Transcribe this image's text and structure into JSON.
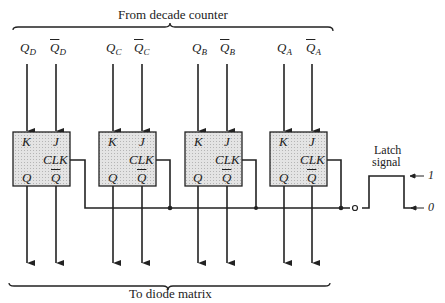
{
  "title_top": "From decade counter",
  "title_bottom": "To diode matrix",
  "inputs": [
    {
      "label": "Q",
      "sub": "D",
      "bar": false
    },
    {
      "label": "Q",
      "sub": "D",
      "bar": true
    },
    {
      "label": "Q",
      "sub": "C",
      "bar": false
    },
    {
      "label": "Q",
      "sub": "C",
      "bar": true
    },
    {
      "label": "Q",
      "sub": "B",
      "bar": false
    },
    {
      "label": "Q",
      "sub": "B",
      "bar": true
    },
    {
      "label": "Q",
      "sub": "A",
      "bar": false
    },
    {
      "label": "Q",
      "sub": "A",
      "bar": true
    }
  ],
  "flipflops": [
    {
      "k": "K",
      "j": "J",
      "clk": "CLK",
      "q": "Q",
      "qbar": "Q"
    },
    {
      "k": "K",
      "j": "J",
      "clk": "CLK",
      "q": "Q",
      "qbar": "Q"
    },
    {
      "k": "K",
      "j": "J",
      "clk": "CLK",
      "q": "Q",
      "qbar": "Q"
    },
    {
      "k": "K",
      "j": "J",
      "clk": "CLK",
      "q": "Q",
      "qbar": "Q"
    }
  ],
  "latch": {
    "label_line1": "Latch",
    "label_line2": "signal",
    "high": "1",
    "low": "0"
  },
  "colors": {
    "line": "#222222",
    "box_fill": "#d9d9d9"
  }
}
